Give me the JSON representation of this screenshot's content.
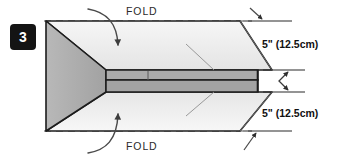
{
  "diagram": {
    "step_number": "3",
    "fold_label_top": "FOLD",
    "fold_label_bottom": "FOLD",
    "dimension_top": "5\" (12.5cm)",
    "dimension_bottom": "5\" (12.5cm)",
    "colors": {
      "badge_background": "#141414",
      "badge_text": "#ffffff",
      "flap_light": "#f2f2f2",
      "flap_mid": "#d9d9d9",
      "body_gray": "#a9a9a9",
      "body_gray_dark": "#9a9a9a",
      "outline": "#1a1a1a",
      "dashed_line": "#8a8a8a",
      "arrow": "#4a4a4a",
      "background": "#ffffff"
    },
    "icons": {
      "fold_arrow_top": "curved-arrow-down-icon",
      "fold_arrow_bottom": "curved-arrow-up-icon",
      "dimension_arrow_top": "arrow-down-right-icon",
      "dimension_arrow_bottom": "arrow-up-right-icon",
      "height_arrow": "double-headed-vertical-arrow-icon"
    }
  }
}
